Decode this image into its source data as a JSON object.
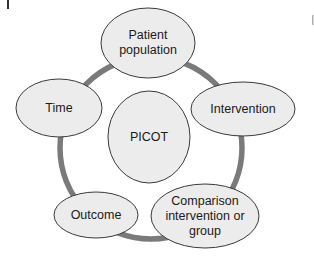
{
  "diagram": {
    "center": {
      "label": "PICOT"
    },
    "nodes": [
      {
        "id": "patient-population",
        "label": "Patient population",
        "lines": [
          "Patient",
          "population"
        ]
      },
      {
        "id": "intervention",
        "label": "Intervention",
        "lines": [
          "Intervention"
        ]
      },
      {
        "id": "comparison",
        "label": "Comparison intervention or group",
        "lines": [
          "Comparison",
          "intervention or",
          "group"
        ]
      },
      {
        "id": "outcome",
        "label": "Outcome",
        "lines": [
          "Outcome"
        ]
      },
      {
        "id": "time",
        "label": "Time",
        "lines": [
          "Time"
        ]
      }
    ],
    "colors": {
      "ring": "#7a7a7a",
      "node_fill": "#ececec",
      "node_stroke": "#3a3a3a",
      "text": "#1a1a1a"
    }
  }
}
